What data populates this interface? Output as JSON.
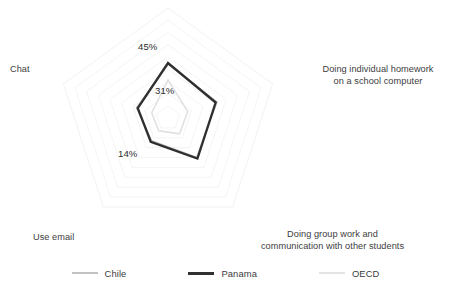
{
  "chart_data": {
    "type": "radar",
    "title": "",
    "subtitle": "",
    "xlabel": "",
    "ylabel": "",
    "grid": true,
    "grid_rings": 9,
    "rmin": 0,
    "rmax": 90,
    "legend_position": "bottom",
    "axes": [
      {
        "key": "homework",
        "label": "Doing individual homework\non a school computer"
      },
      {
        "key": "groupwork",
        "label": "Doing group work and\ncommunication with other students"
      },
      {
        "key": "use_email",
        "label": "Use email"
      },
      {
        "key": "chat",
        "label": "Chat"
      },
      {
        "key": "top",
        "label": ""
      }
    ],
    "categories": [
      "Doing individual homework on a school computer",
      "Doing group work and communication with other students",
      "Use email",
      "Chat",
      ""
    ],
    "series": [
      {
        "name": "Chile",
        "color": "#b9b9b9",
        "width": 1.6,
        "values": [
          42,
          40,
          23,
          27,
          44
        ]
      },
      {
        "name": "Panama",
        "color": "#2f2f2f",
        "width": 2.3,
        "values": [
          41,
          41,
          24,
          26,
          45
        ]
      },
      {
        "name": "OECD",
        "color": "#e0e0e0",
        "width": 1.5,
        "values": [
          17,
          16,
          13,
          14,
          31
        ]
      }
    ],
    "annotations": [
      {
        "text": "45%",
        "axis": "top",
        "value": 45
      },
      {
        "text": "31%",
        "axis": "top",
        "value": 31
      },
      {
        "text": "14%",
        "axis": "use_email",
        "value": 14
      }
    ]
  },
  "labels": {
    "homework": "Doing individual homework\non a school computer",
    "groupwork": "Doing group work and\ncommunication with other students",
    "use_email": "Use email",
    "chat": "Chat"
  },
  "values": {
    "top_outer": "45%",
    "top_inner": "31%",
    "left_lower": "14%"
  },
  "legend": {
    "items": [
      {
        "label": "Chile",
        "color": "#c2c2c2",
        "thickness": 2
      },
      {
        "label": "Panama",
        "color": "#313131",
        "thickness": 3
      },
      {
        "label": "OECD",
        "color": "#e4e4e4",
        "thickness": 2
      }
    ]
  },
  "colors": {
    "grid": "#f0f0f0",
    "chile": "#b9b9b9",
    "panama": "#2f2f2f",
    "oecd": "#e0e0e0",
    "text": "#3d3d3d",
    "background": "#ffffff"
  }
}
